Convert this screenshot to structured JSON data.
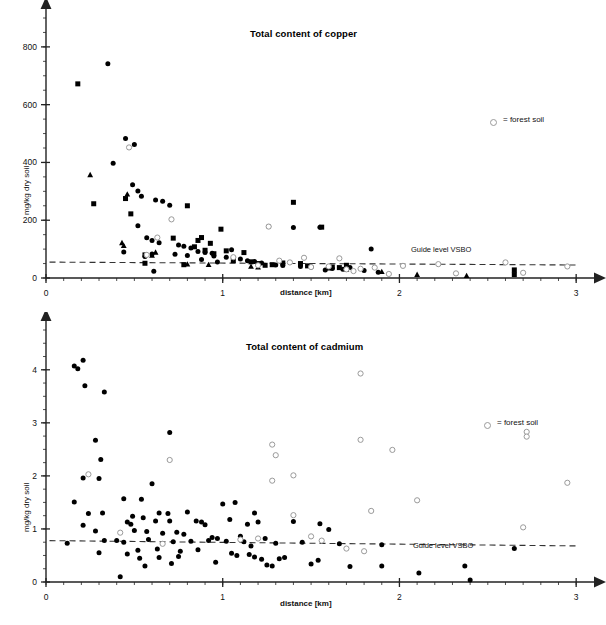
{
  "figure": {
    "legend_text": "= forest soil",
    "guide_label": "Guide level VSBO",
    "xlabel": "distance [km]",
    "ylabel": "mg/kg dry soil",
    "marker_colors": {
      "filled": "#000000",
      "open_stroke": "#9a9a9a",
      "open_fill": "#ffffff",
      "axis": "#222222",
      "guide_line": "#333333"
    }
  },
  "chart_data": [
    {
      "type": "scatter",
      "id": "copper",
      "title": "Total content of copper",
      "xlabel": "distance [km]",
      "ylabel": "mg/kg dry soil",
      "xlim": [
        0,
        3.05
      ],
      "ylim": [
        0,
        900
      ],
      "xticks": [
        0,
        1,
        2,
        3
      ],
      "xticklabels": [
        "0",
        "1",
        "2",
        "3"
      ],
      "xminorstep": 0.1,
      "yticks": [
        0,
        200,
        400,
        600,
        800
      ],
      "yticklabels": [
        "0",
        "200",
        "400",
        "600",
        "800"
      ],
      "yminorstep": 50,
      "grid": false,
      "legend_position": "upper-right",
      "annotations": [
        {
          "text": "Guide level VSBO",
          "x": 2.05,
          "y": 70
        },
        {
          "text": "= forest soil",
          "x": 2.45,
          "y": 600
        }
      ],
      "guide_line": {
        "label": "Guide level VSBO",
        "x0": 0.02,
        "y0": 55,
        "x1": 3.0,
        "y1": 45,
        "style": "dashed"
      },
      "series": [
        {
          "name": "agricultural soil (circle)",
          "marker": "filled-circle",
          "points": [
            [
              0.35,
              742
            ],
            [
              0.45,
              483
            ],
            [
              0.38,
              397
            ],
            [
              0.5,
              462
            ],
            [
              0.49,
              323
            ],
            [
              0.52,
              301
            ],
            [
              0.54,
              283
            ],
            [
              0.62,
              270
            ],
            [
              0.66,
              266
            ],
            [
              0.7,
              252
            ],
            [
              0.52,
              181
            ],
            [
              0.57,
              139
            ],
            [
              0.6,
              130
            ],
            [
              0.64,
              122
            ],
            [
              0.75,
              114
            ],
            [
              0.78,
              110
            ],
            [
              0.82,
              104
            ],
            [
              0.86,
              92
            ],
            [
              0.9,
              88
            ],
            [
              0.94,
              86
            ],
            [
              0.6,
              83
            ],
            [
              0.73,
              82
            ],
            [
              0.8,
              78
            ],
            [
              0.95,
              76
            ],
            [
              1.02,
              72
            ],
            [
              1.06,
              70
            ],
            [
              1.1,
              66
            ],
            [
              1.14,
              60
            ],
            [
              1.18,
              57
            ],
            [
              1.22,
              52
            ],
            [
              0.61,
              23
            ],
            [
              1.4,
              175
            ],
            [
              1.55,
              176
            ],
            [
              1.84,
              100
            ],
            [
              1.26,
              178
            ],
            [
              1.05,
              98
            ],
            [
              0.88,
              64
            ],
            [
              0.97,
              55
            ],
            [
              1.3,
              45
            ],
            [
              1.34,
              43
            ],
            [
              1.44,
              40
            ],
            [
              1.5,
              38
            ],
            [
              1.58,
              28
            ],
            [
              1.62,
              33
            ],
            [
              1.68,
              30
            ],
            [
              1.72,
              36
            ],
            [
              1.8,
              26
            ],
            [
              1.88,
              20
            ],
            [
              0.44,
              90
            ],
            [
              0.56,
              74
            ]
          ]
        },
        {
          "name": "agricultural soil (square)",
          "marker": "filled-square",
          "points": [
            [
              0.18,
              672
            ],
            [
              0.27,
              257
            ],
            [
              0.45,
              275
            ],
            [
              0.48,
              222
            ],
            [
              0.56,
              51
            ],
            [
              0.56,
              80
            ],
            [
              0.78,
              46
            ],
            [
              0.8,
              250
            ],
            [
              0.86,
              130
            ],
            [
              0.9,
              96
            ],
            [
              0.93,
              120
            ],
            [
              0.95,
              84
            ],
            [
              0.99,
              169
            ],
            [
              1.02,
              94
            ],
            [
              1.06,
              60
            ],
            [
              1.12,
              88
            ],
            [
              1.16,
              56
            ],
            [
              1.2,
              50
            ],
            [
              1.24,
              44
            ],
            [
              1.28,
              46
            ],
            [
              1.4,
              262
            ],
            [
              1.56,
              176
            ],
            [
              0.88,
              140
            ],
            [
              1.34,
              52
            ],
            [
              1.44,
              50
            ],
            [
              1.48,
              42
            ],
            [
              1.62,
              38
            ],
            [
              1.66,
              36
            ],
            [
              1.7,
              44
            ],
            [
              2.65,
              28
            ],
            [
              2.65,
              12
            ],
            [
              0.72,
              138
            ],
            [
              0.84,
              108
            ]
          ]
        },
        {
          "name": "agricultural soil (triangle)",
          "marker": "filled-triangle",
          "points": [
            [
              0.25,
              357
            ],
            [
              0.46,
              290
            ],
            [
              0.44,
              112
            ],
            [
              0.43,
              122
            ],
            [
              0.6,
              78
            ],
            [
              0.62,
              89
            ],
            [
              0.8,
              48
            ],
            [
              1.16,
              40
            ],
            [
              1.2,
              38
            ],
            [
              1.6,
              34
            ],
            [
              1.7,
              30
            ],
            [
              1.9,
              22
            ],
            [
              2.1,
              12
            ],
            [
              2.38,
              8
            ],
            [
              0.92,
              46
            ]
          ]
        },
        {
          "name": "forest soil",
          "marker": "open-circle",
          "points": [
            [
              0.47,
              452
            ],
            [
              0.71,
              203
            ],
            [
              0.57,
              80
            ],
            [
              1.06,
              72
            ],
            [
              1.26,
              178
            ],
            [
              1.32,
              60
            ],
            [
              1.38,
              54
            ],
            [
              1.46,
              70
            ],
            [
              1.5,
              38
            ],
            [
              1.6,
              40
            ],
            [
              1.66,
              68
            ],
            [
              1.7,
              30
            ],
            [
              1.74,
              24
            ],
            [
              1.78,
              32
            ],
            [
              1.86,
              36
            ],
            [
              1.94,
              14
            ],
            [
              2.02,
              42
            ],
            [
              2.22,
              48
            ],
            [
              2.32,
              16
            ],
            [
              2.6,
              54
            ],
            [
              2.7,
              18
            ],
            [
              2.95,
              40
            ],
            [
              0.63,
              140
            ],
            [
              1.2,
              44
            ]
          ]
        }
      ]
    },
    {
      "type": "scatter",
      "id": "cadmium",
      "title": "Total content of cadmium",
      "xlabel": "distance [km]",
      "ylabel": "mg/kg dry soil",
      "xlim": [
        0,
        3.05
      ],
      "ylim": [
        0,
        4.75
      ],
      "xticks": [
        0,
        1,
        2,
        3
      ],
      "xticklabels": [
        "0",
        "1",
        "2",
        "3"
      ],
      "xminorstep": 0.1,
      "yticks": [
        0,
        1,
        2,
        3,
        4
      ],
      "yticklabels": [
        "0",
        "1",
        "2",
        "3",
        "4"
      ],
      "yminorstep": 0.25,
      "grid": false,
      "legend_position": "upper-right",
      "annotations": [
        {
          "text": "Guide level VSBO",
          "x": 2.05,
          "y": 0.86
        },
        {
          "text": "= forest soil",
          "x": 2.45,
          "y": 3.28
        }
      ],
      "guide_line": {
        "label": "Guide level VSBO",
        "x0": 0.02,
        "y0": 0.78,
        "x1": 3.0,
        "y1": 0.68,
        "style": "dashed"
      },
      "series": [
        {
          "name": "agricultural soil",
          "marker": "filled-circle",
          "points": [
            [
              0.16,
              4.07
            ],
            [
              0.18,
              4.02
            ],
            [
              0.21,
              4.18
            ],
            [
              0.22,
              3.7
            ],
            [
              0.33,
              3.58
            ],
            [
              0.7,
              2.82
            ],
            [
              0.28,
              2.67
            ],
            [
              0.31,
              2.31
            ],
            [
              0.21,
              1.96
            ],
            [
              0.3,
              1.95
            ],
            [
              0.6,
              1.85
            ],
            [
              0.16,
              1.51
            ],
            [
              0.44,
              1.57
            ],
            [
              0.54,
              1.56
            ],
            [
              1.0,
              1.47
            ],
            [
              1.07,
              1.5
            ],
            [
              0.24,
              1.29
            ],
            [
              0.32,
              1.3
            ],
            [
              0.64,
              1.3
            ],
            [
              0.69,
              1.29
            ],
            [
              0.8,
              1.32
            ],
            [
              1.18,
              1.3
            ],
            [
              0.49,
              1.24
            ],
            [
              0.55,
              1.21
            ],
            [
              0.85,
              1.15
            ],
            [
              0.88,
              1.13
            ],
            [
              1.04,
              1.18
            ],
            [
              1.4,
              1.14
            ],
            [
              1.55,
              1.1
            ],
            [
              1.6,
              0.99
            ],
            [
              0.21,
              1.07
            ],
            [
              0.46,
              1.13
            ],
            [
              0.48,
              1.09
            ],
            [
              0.62,
              1.15
            ],
            [
              0.7,
              1.15
            ],
            [
              0.9,
              1.08
            ],
            [
              1.14,
              1.09
            ],
            [
              1.2,
              1.13
            ],
            [
              0.28,
              0.96
            ],
            [
              0.5,
              0.97
            ],
            [
              0.57,
              0.95
            ],
            [
              0.66,
              0.92
            ],
            [
              0.74,
              0.94
            ],
            [
              0.78,
              0.9
            ],
            [
              0.94,
              0.84
            ],
            [
              0.97,
              0.82
            ],
            [
              1.1,
              0.86
            ],
            [
              1.24,
              0.82
            ],
            [
              0.12,
              0.73
            ],
            [
              0.33,
              0.78
            ],
            [
              0.4,
              0.78
            ],
            [
              0.44,
              0.75
            ],
            [
              0.58,
              0.8
            ],
            [
              0.72,
              0.76
            ],
            [
              0.82,
              0.77
            ],
            [
              0.92,
              0.78
            ],
            [
              1.02,
              0.77
            ],
            [
              1.12,
              0.76
            ],
            [
              1.3,
              0.73
            ],
            [
              1.45,
              0.75
            ],
            [
              1.66,
              0.72
            ],
            [
              1.9,
              0.7
            ],
            [
              2.65,
              0.63
            ],
            [
              0.3,
              0.55
            ],
            [
              0.46,
              0.53
            ],
            [
              0.52,
              0.6
            ],
            [
              0.53,
              0.45
            ],
            [
              0.63,
              0.62
            ],
            [
              0.76,
              0.58
            ],
            [
              0.86,
              0.61
            ],
            [
              1.05,
              0.54
            ],
            [
              1.08,
              0.5
            ],
            [
              1.15,
              0.52
            ],
            [
              1.18,
              0.47
            ],
            [
              1.22,
              0.43
            ],
            [
              1.25,
              0.32
            ],
            [
              1.28,
              0.3
            ],
            [
              1.35,
              0.46
            ],
            [
              1.5,
              0.34
            ],
            [
              1.54,
              0.41
            ],
            [
              0.42,
              0.1
            ],
            [
              0.56,
              0.3
            ],
            [
              0.71,
              0.35
            ],
            [
              0.96,
              0.37
            ],
            [
              1.72,
              0.29
            ],
            [
              1.9,
              0.3
            ],
            [
              2.11,
              0.17
            ],
            [
              2.37,
              0.3
            ],
            [
              2.4,
              0.04
            ],
            [
              0.64,
              0.46
            ],
            [
              0.75,
              0.48
            ],
            [
              1.16,
              0.68
            ],
            [
              1.32,
              0.44
            ]
          ]
        },
        {
          "name": "forest soil",
          "marker": "open-circle",
          "points": [
            [
              1.78,
              3.93
            ],
            [
              2.72,
              2.83
            ],
            [
              2.72,
              2.74
            ],
            [
              1.78,
              2.68
            ],
            [
              1.96,
              2.49
            ],
            [
              1.28,
              2.59
            ],
            [
              1.3,
              2.39
            ],
            [
              0.7,
              2.3
            ],
            [
              0.24,
              2.03
            ],
            [
              1.4,
              2.01
            ],
            [
              1.28,
              1.91
            ],
            [
              2.95,
              1.87
            ],
            [
              2.1,
              1.54
            ],
            [
              1.84,
              1.34
            ],
            [
              1.4,
              1.26
            ],
            [
              2.7,
              1.03
            ],
            [
              0.42,
              0.93
            ],
            [
              1.5,
              0.86
            ],
            [
              1.2,
              0.82
            ],
            [
              1.56,
              0.78
            ],
            [
              1.7,
              0.63
            ],
            [
              1.8,
              0.58
            ],
            [
              0.66,
              0.72
            ],
            [
              1.1,
              0.8
            ]
          ]
        }
      ]
    }
  ]
}
